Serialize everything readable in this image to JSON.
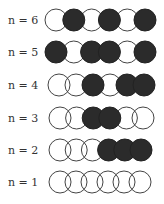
{
  "diagram": {
    "colors": {
      "filled": "#2b2b2b",
      "outline": "#444444",
      "background": "#ffffff"
    },
    "rows": [
      {
        "label": "n = 6",
        "cy": 20,
        "x0": 56,
        "dx": 17.8,
        "states": [
          0,
          1,
          0,
          1,
          0,
          1
        ]
      },
      {
        "label": "n = 5",
        "cy": 52,
        "x0": 56,
        "dx": 17.8,
        "states": [
          1,
          0,
          1,
          1,
          0,
          1
        ]
      },
      {
        "label": "n = 4",
        "cy": 85,
        "x0": 59,
        "dx": 17.0,
        "states": [
          0,
          0,
          1,
          0,
          1,
          1
        ]
      },
      {
        "label": "n = 3",
        "cy": 118,
        "x0": 60,
        "dx": 16.6,
        "states": [
          0,
          0,
          1,
          1,
          0,
          0
        ]
      },
      {
        "label": "n = 2",
        "cy": 150,
        "x0": 60,
        "dx": 16.2,
        "states": [
          0,
          0,
          0,
          1,
          1,
          1
        ]
      },
      {
        "label": "n = 1",
        "cy": 182,
        "x0": 60,
        "dx": 16.0,
        "states": [
          0,
          0,
          0,
          0,
          0,
          0
        ]
      }
    ],
    "circle_radius": 11,
    "label_x": 8
  }
}
